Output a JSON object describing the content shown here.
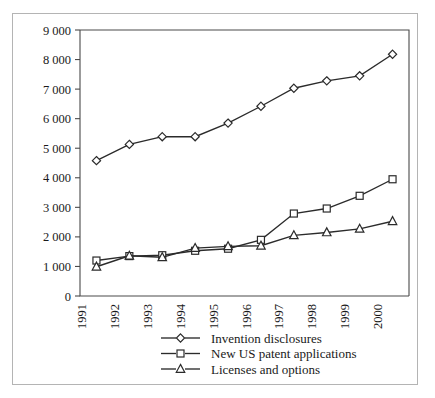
{
  "chart_data": {
    "type": "line",
    "title": "",
    "subtitle": "",
    "xlabel": "",
    "ylabel": "",
    "x": [
      1991,
      1992,
      1993,
      1994,
      1995,
      1996,
      1997,
      1998,
      1999,
      2000
    ],
    "categories": [
      "1991",
      "1992",
      "1993",
      "1994",
      "1995",
      "1996",
      "1997",
      "1998",
      "1999",
      "2000"
    ],
    "xtick_labels": [
      "1991",
      "1992",
      "1993",
      "1994",
      "1995",
      "1996",
      "1997",
      "1998",
      "1999",
      "2000"
    ],
    "ytick_labels": [
      "0",
      "1 000",
      "2 000",
      "3 000",
      "4 000",
      "5 000",
      "6 000",
      "7 000",
      "8 000",
      "9 000"
    ],
    "ytick_values": [
      0,
      1000,
      2000,
      3000,
      4000,
      5000,
      6000,
      7000,
      8000,
      9000
    ],
    "ylim": [
      0,
      9000
    ],
    "xlim": [
      1991,
      2001
    ],
    "grid": false,
    "legend_position": "bottom",
    "series": [
      {
        "name": "Invention disclosures",
        "marker": "diamond",
        "values": [
          4580,
          5130,
          5390,
          5390,
          5850,
          6420,
          7030,
          7280,
          7450,
          8180
        ]
      },
      {
        "name": "New US patent applications",
        "marker": "square",
        "values": [
          1200,
          1350,
          1380,
          1530,
          1600,
          1900,
          2790,
          2960,
          3390,
          3950
        ]
      },
      {
        "name": "Licenses and options",
        "marker": "triangle",
        "values": [
          990,
          1360,
          1310,
          1620,
          1680,
          1700,
          2050,
          2150,
          2270,
          2530
        ]
      }
    ]
  },
  "legend": {
    "items": [
      {
        "label": "Invention disclosures",
        "marker": "diamond"
      },
      {
        "label": "New US patent applications",
        "marker": "square"
      },
      {
        "label": "Licenses and options",
        "marker": "triangle"
      }
    ]
  },
  "colors": {
    "line": "#2b2b2b",
    "axis": "#4a4a4a",
    "text": "#1a1a1a",
    "frame": "#b4b4b4",
    "background": "#ffffff"
  }
}
